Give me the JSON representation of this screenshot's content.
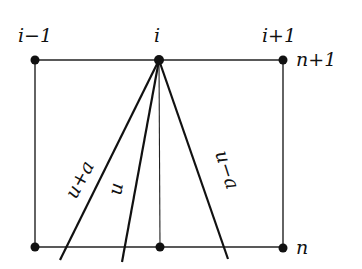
{
  "diagram": {
    "type": "finite-difference stencil / characteristics",
    "column_labels": {
      "left": "i−1",
      "center": "i",
      "right": "i+1"
    },
    "row_labels": {
      "top": "n+1",
      "bottom": "n"
    },
    "characteristics": [
      {
        "label": "u+a",
        "from": [
          159,
          60
        ],
        "to": [
          60,
          260
        ]
      },
      {
        "label": "u",
        "from": [
          159,
          60
        ],
        "to": [
          122,
          262
        ]
      },
      {
        "label": "u−a",
        "from": [
          159,
          60
        ],
        "to": [
          228,
          259
        ]
      }
    ],
    "nodes": [
      {
        "name": "i-1,n+1",
        "x": 35,
        "y": 60
      },
      {
        "name": "i,n+1",
        "x": 159,
        "y": 60
      },
      {
        "name": "i+1,n+1",
        "x": 283,
        "y": 60
      },
      {
        "name": "i-1,n",
        "x": 35,
        "y": 247
      },
      {
        "name": "i,n",
        "x": 160,
        "y": 247
      },
      {
        "name": "i+1,n",
        "x": 283,
        "y": 247
      }
    ],
    "colors": {
      "ink": "#111111",
      "background": "#ffffff"
    }
  }
}
